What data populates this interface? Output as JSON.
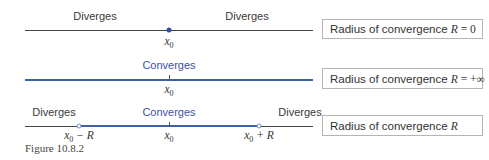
{
  "figure": {
    "caption": "Figure 10.8.2",
    "rows": [
      {
        "labels": {
          "left": "Diverges",
          "right": "Diverges"
        },
        "points": {
          "center": "x",
          "center_sub": "0"
        },
        "box": {
          "text": "Radius of convergence",
          "var": "R",
          "value": "= 0"
        }
      },
      {
        "labels": {
          "center": "Converges"
        },
        "points": {
          "center": "x",
          "center_sub": "0"
        },
        "box": {
          "text": "Radius of convergence",
          "var": "R",
          "value": "= +∞"
        }
      },
      {
        "labels": {
          "left": "Diverges",
          "center": "Converges",
          "right": "Diverges"
        },
        "points": {
          "left": "x",
          "left_sub": "0",
          "left_suffix": " − R",
          "center": "x",
          "center_sub": "0",
          "right": "x",
          "right_sub": "0",
          "right_suffix": " + R"
        },
        "box": {
          "text": "Radius of convergence",
          "var": "R",
          "value": ""
        }
      }
    ],
    "colors": {
      "converges_text": "#3b4fa8",
      "converges_line": "#3d5fa6",
      "diverges_line": "#444444",
      "point": "#2f4fb0"
    }
  }
}
